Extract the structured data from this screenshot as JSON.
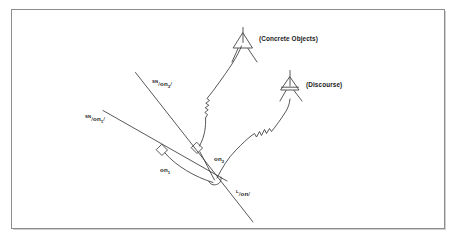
{
  "figure": {
    "type": "linguistic-network-diagram",
    "background_color": "#ffffff",
    "frame_color": "#8d8d8d",
    "stroke_color": "#3a3a3a"
  },
  "terminals": [
    {
      "id": "concrete-objects",
      "label": "(Concrete Objects)",
      "symbol": "triangle",
      "x": 243,
      "y": 42
    },
    {
      "id": "discourse",
      "label": "(Discourse)",
      "symbol": "triangle-barred",
      "x": 290,
      "y": 87
    }
  ],
  "nodes": [
    {
      "id": "node-1",
      "symbol": "diamond",
      "x": 162,
      "y": 150
    },
    {
      "id": "node-2",
      "symbol": "diamond",
      "x": 197,
      "y": 148
    },
    {
      "id": "node-3",
      "symbol": "hook",
      "x": 216,
      "y": 182
    }
  ],
  "labels": {
    "sn_on3": {
      "sup": "SN",
      "slash1": "/",
      "base": "on",
      "sub": "3",
      "slash2": "/",
      "x": 155,
      "y": 83
    },
    "sn_on1": {
      "sup": "SN",
      "slash1": "/",
      "base": "on",
      "sub": "1",
      "slash2": "/",
      "x": 88,
      "y": 118
    },
    "on1": {
      "base": "on",
      "sub": "1",
      "x": 163,
      "y": 169
    },
    "on2": {
      "base": "on",
      "sub": "2",
      "x": 216,
      "y": 158
    },
    "l_on": {
      "sup": "L",
      "slash1": "/",
      "base": "on",
      "slash2": "/",
      "x": 238,
      "y": 192
    }
  },
  "axes": [
    {
      "id": "axis-upper",
      "x1": 135,
      "y1": 72,
      "x2": 253,
      "y2": 222
    },
    {
      "id": "axis-lower",
      "x1": 103,
      "y1": 110,
      "x2": 226,
      "y2": 180
    }
  ],
  "connectors": [
    {
      "id": "connector-node2-concrete",
      "from": "node-2",
      "to": "concrete-objects",
      "style": "curve-with-zigzag"
    },
    {
      "id": "connector-node3-discourse",
      "from": "node-3",
      "to": "discourse",
      "style": "curve-with-zigzag"
    },
    {
      "id": "connector-node1-node3",
      "from": "node-1",
      "to": "node-3",
      "style": "curve"
    },
    {
      "id": "connector-node2-node3",
      "from": "node-2",
      "to": "node-3",
      "style": "curve"
    }
  ]
}
